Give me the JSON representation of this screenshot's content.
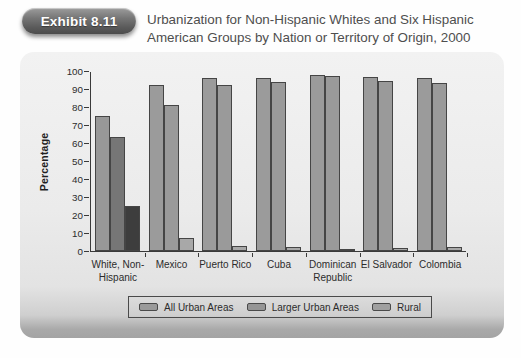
{
  "header": {
    "badge": "Exhibit 8.11",
    "title_line1": "Urbanization for Non-Hispanic Whites and Six Hispanic",
    "title_line2": "American Groups by Nation or Territory of Origin, 2000"
  },
  "colors": {
    "panel_background": "#ebebeb",
    "panel_bottom_band": "#a6a6a6",
    "axis": "#3a3a3a",
    "badge_background": "#5f5f5f",
    "badge_text": "#ffffff",
    "title_text": "#4e4e4e"
  },
  "chart_data": {
    "type": "bar",
    "title": "Urbanization for Non-Hispanic Whites and Six Hispanic American Groups by Nation or Territory of Origin, 2000",
    "xlabel": "",
    "ylabel": "Percentage",
    "ylim": [
      0,
      100
    ],
    "ytick_step": 10,
    "grid": false,
    "legend_position": "bottom",
    "categories": [
      "White, Non-\nHispanic",
      "Mexico",
      "Puerto Rico",
      "Cuba",
      "Dominican\nRepublic",
      "El Salvador",
      "Colombia"
    ],
    "series": [
      {
        "name": "All Urban Areas",
        "values": [
          75,
          92.5,
          96,
          96,
          98,
          96.5,
          96
        ],
        "legend_color": "#9a9a9a"
      },
      {
        "name": "Larger Urban Areas",
        "values": [
          63.5,
          81,
          92,
          94,
          97.5,
          94.5,
          93.5
        ],
        "legend_color": "#959595"
      },
      {
        "name": "Rural",
        "values": [
          25,
          7.5,
          3,
          2.5,
          1,
          1.5,
          2
        ],
        "legend_color": "#a0a0a0"
      }
    ],
    "bar_colors": [
      [
        "#989898",
        "#767676",
        "#3d3d3d"
      ],
      [
        "#9b9b9b",
        "#9a9a9a",
        "#a8a8a8"
      ],
      [
        "#9b9b9b",
        "#9a9a9a",
        "#a8a8a8"
      ],
      [
        "#9b9b9b",
        "#9a9a9a",
        "#a8a8a8"
      ],
      [
        "#9b9b9b",
        "#9a9a9a",
        "#a8a8a8"
      ],
      [
        "#9b9b9b",
        "#9a9a9a",
        "#a8a8a8"
      ],
      [
        "#9b9b9b",
        "#9a9a9a",
        "#a8a8a8"
      ]
    ]
  }
}
